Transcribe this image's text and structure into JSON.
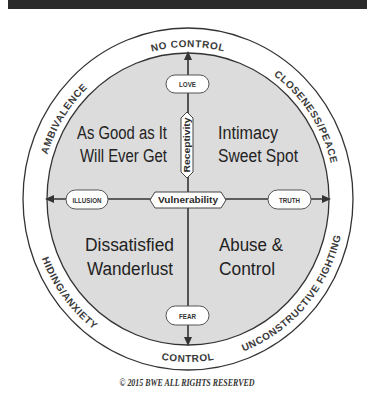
{
  "colors": {
    "header_bar": "#2b2b2b",
    "inner_fill": "#dcdcdc",
    "ring_fill": "#ffffff",
    "stroke": "#333333",
    "text": "#222222"
  },
  "ring": {
    "top": "NO CONTROL",
    "bottom": "CONTROL",
    "upper_left": "AMBIVALENCE",
    "upper_right": "CLOSENESS/PEACE",
    "lower_left": "HIDING/ANXIETY",
    "lower_right": "UNCONSTRUCTIVE FIGHTING"
  },
  "axes": {
    "vertical": {
      "name": "Receptivity",
      "top_label": "LOVE",
      "bottom_label": "FEAR"
    },
    "horizontal": {
      "name": "Vulnerability",
      "left_label": "ILLUSION",
      "right_label": "TRUTH"
    }
  },
  "quadrants": {
    "top_left": {
      "line1": "As Good as It",
      "line2": "Will Ever Get"
    },
    "top_right": {
      "line1": "Intimacy",
      "line2": "Sweet Spot"
    },
    "bottom_left": {
      "line1": "Dissatisfied",
      "line2": "Wanderlust"
    },
    "bottom_right": {
      "line1": "Abuse &",
      "line2": "Control"
    }
  },
  "footer": {
    "copyright": "© 2015 BWE ALL RIGHTS RESERVED"
  }
}
